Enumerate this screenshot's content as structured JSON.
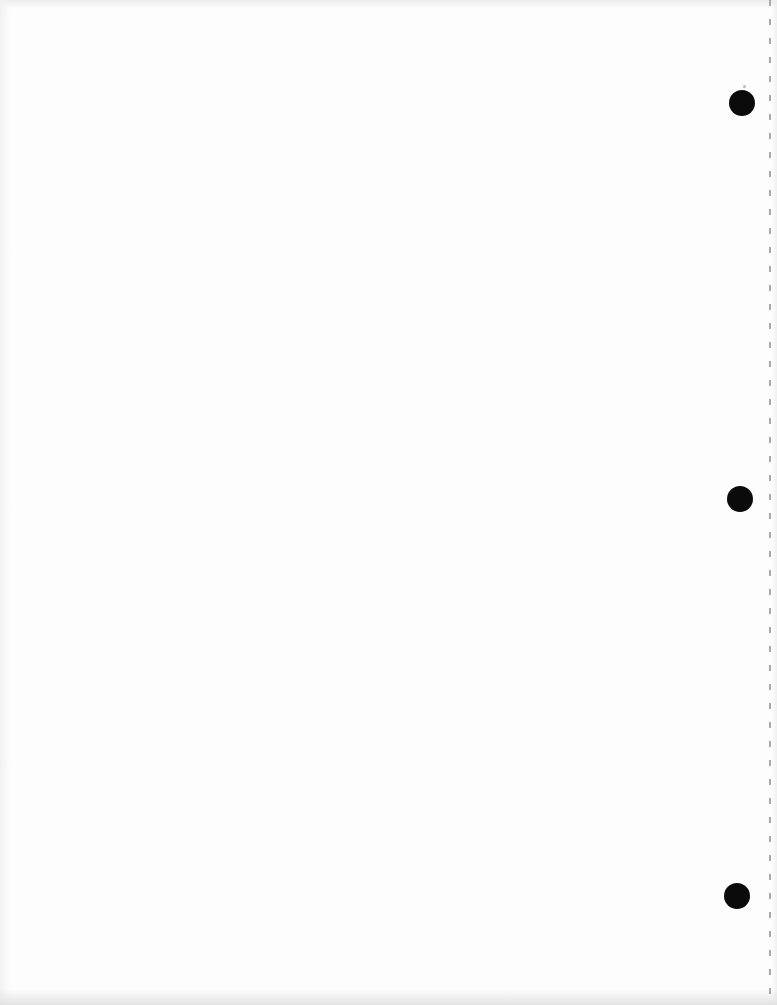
{
  "page": {
    "width": 777,
    "height": 1005,
    "paper_color": "#fdfdfd",
    "content_text": ""
  },
  "hole_punches": {
    "color": "#0b0b0b",
    "radius": 13,
    "items": [
      {
        "cx": 742,
        "cy": 103
      },
      {
        "cx": 740,
        "cy": 499
      },
      {
        "cx": 737,
        "cy": 896
      }
    ]
  },
  "perforation_line": {
    "x": 769,
    "width": 2,
    "dash_length": 6,
    "gap_length": 13,
    "color": "#a9a9a9"
  },
  "scan_specks": [
    {
      "cx": 744,
      "cy": 86,
      "size": 3,
      "color": "#b9b9b9"
    }
  ],
  "edge_shading": {
    "top": "#ececec",
    "bottom": "#e3e3e3",
    "left": "#f2f2f2",
    "right": "#f0f0f0"
  }
}
